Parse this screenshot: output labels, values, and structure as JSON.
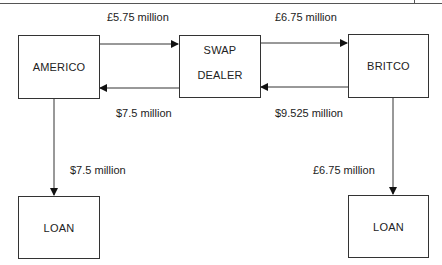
{
  "diagram": {
    "type": "currency-swap-flow",
    "nodes": {
      "americo": {
        "label": "AMERICO"
      },
      "swap_dealer": {
        "line1": "SWAP",
        "line2": "DEALER"
      },
      "britco": {
        "label": "BRITCO"
      },
      "loan_left": {
        "label": "LOAN"
      },
      "loan_right": {
        "label": "LOAN"
      }
    },
    "edges": {
      "americo_to_dealer": {
        "label": "£5.75 million",
        "from": "AMERICO",
        "to": "SWAP DEALER"
      },
      "dealer_to_americo": {
        "label": "$7.5 million",
        "from": "SWAP DEALER",
        "to": "AMERICO"
      },
      "dealer_to_britco": {
        "label": "£6.75 million",
        "from": "SWAP DEALER",
        "to": "BRITCO"
      },
      "britco_to_dealer": {
        "label": "$9.525 million",
        "from": "BRITCO",
        "to": "SWAP DEALER"
      },
      "americo_to_loan": {
        "label": "$7.5 million",
        "from": "AMERICO",
        "to": "LOAN"
      },
      "britco_to_loan": {
        "label": "£6.75 million",
        "from": "BRITCO",
        "to": "LOAN"
      }
    }
  }
}
